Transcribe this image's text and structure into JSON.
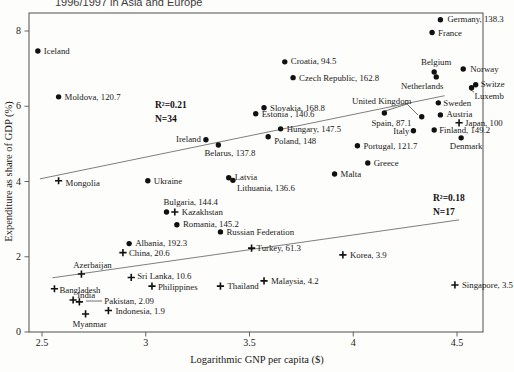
{
  "title": "1996/1997 in Asia and Europe",
  "chart_data": {
    "type": "scatter",
    "title": "1996/1997 in Asia and Europe",
    "xlabel": "Logarithmic GNP per capita ($)",
    "ylabel": "Expenditure as share of GDP (%)",
    "xlim": [
      2.44,
      4.63
    ],
    "ylim": [
      0,
      8.48
    ],
    "x_ticks": [
      "2.5",
      "3",
      "3.5",
      "4",
      "4.5"
    ],
    "x_tick_values": [
      2.5,
      3,
      3.5,
      4,
      4.5
    ],
    "y_ticks": [
      "0",
      "2",
      "4",
      "6",
      "8"
    ],
    "y_tick_values": [
      0,
      2,
      4,
      6,
      8
    ],
    "grid": false,
    "legend_position": "none",
    "marker_color": "#111111",
    "series": [
      {
        "name": "europe",
        "marker": "dot",
        "stat_label": "R²=0.21",
        "n_label": "N=34",
        "points": [
          {
            "name": "iceland",
            "label": "Iceland",
            "x": 2.48,
            "y": 7.47,
            "anchor": "start",
            "dx": 6,
            "dy": 0
          },
          {
            "name": "moldova",
            "label": "Moldova, 120.7",
            "x": 2.58,
            "y": 6.25,
            "anchor": "start",
            "dx": 6,
            "dy": 0
          },
          {
            "name": "germany",
            "label": "Germany, 138.3",
            "x": 4.42,
            "y": 8.3,
            "anchor": "start",
            "dx": 7,
            "dy": -1
          },
          {
            "name": "france",
            "label": "France",
            "x": 4.38,
            "y": 7.96,
            "anchor": "start",
            "dx": 6,
            "dy": 0
          },
          {
            "name": "croatia",
            "label": "Croatia, 94.5",
            "x": 3.67,
            "y": 7.18,
            "anchor": "start",
            "dx": 6,
            "dy": -1
          },
          {
            "name": "czech-republic",
            "label": "Czech Republic, 162.8",
            "x": 3.71,
            "y": 6.76,
            "anchor": "start",
            "dx": 6,
            "dy": 0
          },
          {
            "name": "belgium",
            "label": "Belgium",
            "x": 4.39,
            "y": 6.91,
            "anchor": "middle",
            "dx": 2,
            "dy": -10
          },
          {
            "name": "netherlands",
            "label": "Netherlands",
            "x": 4.4,
            "y": 6.78,
            "anchor": "middle",
            "dx": -14,
            "dy": 9
          },
          {
            "name": "norway",
            "label": "Norway",
            "x": 4.53,
            "y": 6.99,
            "anchor": "start",
            "dx": 7,
            "dy": 0
          },
          {
            "name": "switzerland",
            "label": "Switze",
            "x": 4.59,
            "y": 6.57,
            "anchor": "start",
            "dx": 5,
            "dy": -1
          },
          {
            "name": "luxembourg",
            "label": "Luxemb",
            "x": 4.57,
            "y": 6.49,
            "anchor": "start",
            "dx": 3,
            "dy": 8
          },
          {
            "name": "sweden",
            "label": "Sweden",
            "x": 4.41,
            "y": 6.09,
            "anchor": "start",
            "dx": 5,
            "dy": 0
          },
          {
            "name": "austria",
            "label": "Austria",
            "x": 4.42,
            "y": 5.77,
            "anchor": "start",
            "dx": 6,
            "dy": -1
          },
          {
            "name": "united-kingdom",
            "label": "United Kingdom",
            "x": 4.33,
            "y": 5.72,
            "anchor": "middle",
            "dx": -40,
            "dy": -16
          },
          {
            "name": "spain",
            "label": "Spain, 87.1",
            "x": 4.15,
            "y": 5.82,
            "anchor": "middle",
            "dx": 7,
            "dy": 10
          },
          {
            "name": "italy",
            "label": "Italy",
            "x": 4.29,
            "y": 5.35,
            "anchor": "end",
            "dx": -4,
            "dy": 0
          },
          {
            "name": "finland",
            "label": "Finland, 149.2",
            "x": 4.39,
            "y": 5.37,
            "anchor": "start",
            "dx": 5,
            "dy": 0
          },
          {
            "name": "denmark",
            "label": "Denmark",
            "x": 4.52,
            "y": 5.16,
            "anchor": "middle",
            "dx": 5,
            "dy": 8
          },
          {
            "name": "slovakia",
            "label": "Slovakia, 168.8",
            "x": 3.57,
            "y": 5.96,
            "anchor": "start",
            "dx": 6,
            "dy": 0
          },
          {
            "name": "estonia",
            "label": "Estonia , 140.6",
            "x": 3.53,
            "y": 5.8,
            "anchor": "start",
            "dx": 6,
            "dy": 0
          },
          {
            "name": "hungary",
            "label": "Hungary, 147.5",
            "x": 3.65,
            "y": 5.4,
            "anchor": "start",
            "dx": 6,
            "dy": 0
          },
          {
            "name": "poland",
            "label": "Poland, 148",
            "x": 3.59,
            "y": 5.19,
            "anchor": "start",
            "dx": 6,
            "dy": 4
          },
          {
            "name": "ireland",
            "label": "Ireland",
            "x": 3.29,
            "y": 5.11,
            "anchor": "end",
            "dx": -5,
            "dy": -1
          },
          {
            "name": "belarus",
            "label": "Belarus, 137.8",
            "x": 3.35,
            "y": 4.97,
            "anchor": "start",
            "dx": -14,
            "dy": 8
          },
          {
            "name": "ukraine",
            "label": "Ukraine",
            "x": 3.01,
            "y": 4.02,
            "anchor": "start",
            "dx": 6,
            "dy": 0
          },
          {
            "name": "latvia",
            "label": "Latvia",
            "x": 3.4,
            "y": 4.1,
            "anchor": "start",
            "dx": 6,
            "dy": -1
          },
          {
            "name": "lithuania",
            "label": "Lithuania, 136.6",
            "x": 3.42,
            "y": 4.03,
            "anchor": "start",
            "dx": 4,
            "dy": 8
          },
          {
            "name": "bulgaria",
            "label": "Bulgaria, 144.4",
            "x": 3.1,
            "y": 3.19,
            "anchor": "start",
            "dx": -3,
            "dy": -10
          },
          {
            "name": "romania",
            "label": "Romania, 145.2",
            "x": 3.15,
            "y": 2.85,
            "anchor": "start",
            "dx": 6,
            "dy": -1
          },
          {
            "name": "russian-federation",
            "label": "Russian Federation",
            "x": 3.36,
            "y": 2.66,
            "anchor": "start",
            "dx": 6,
            "dy": 0
          },
          {
            "name": "albania",
            "label": "Albania, 192.3",
            "x": 2.92,
            "y": 2.35,
            "anchor": "start",
            "dx": 6,
            "dy": -1
          },
          {
            "name": "greece",
            "label": "Greece",
            "x": 4.07,
            "y": 4.49,
            "anchor": "start",
            "dx": 6,
            "dy": 0
          },
          {
            "name": "malta",
            "label": "Malta",
            "x": 3.91,
            "y": 4.2,
            "anchor": "start",
            "dx": 6,
            "dy": 0
          },
          {
            "name": "portugal",
            "label": "Portugal, 121.7",
            "x": 4.02,
            "y": 4.95,
            "anchor": "start",
            "dx": 6,
            "dy": 0
          }
        ]
      },
      {
        "name": "asia",
        "marker": "cross",
        "stat_label": "R²=0.18",
        "n_label": "N=17",
        "points": [
          {
            "name": "japan",
            "label": "Japan, 100",
            "x": 4.51,
            "y": 5.56,
            "anchor": "start",
            "dx": 6,
            "dy": 0
          },
          {
            "name": "mongolia",
            "label": "Mongolia",
            "x": 2.58,
            "y": 4.02,
            "anchor": "start",
            "dx": 7,
            "dy": 2
          },
          {
            "name": "kazakhstan",
            "label": "Kazakhstan",
            "x": 3.14,
            "y": 3.19,
            "anchor": "start",
            "dx": 7,
            "dy": 0
          },
          {
            "name": "china",
            "label": "China, 20.6",
            "x": 2.89,
            "y": 2.11,
            "anchor": "start",
            "dx": 6,
            "dy": 0
          },
          {
            "name": "azerbaijan",
            "label": "Azerbaijan",
            "x": 2.69,
            "y": 1.54,
            "anchor": "middle",
            "dx": 11,
            "dy": -9
          },
          {
            "name": "sri-lanka",
            "label": "Sri Lanka, 10.6",
            "x": 2.93,
            "y": 1.45,
            "anchor": "start",
            "dx": 6,
            "dy": -1
          },
          {
            "name": "bangladesh",
            "label": "Bangladesh",
            "x": 2.56,
            "y": 1.15,
            "anchor": "start",
            "dx": 5,
            "dy": 1
          },
          {
            "name": "philippines",
            "label": "Philippines",
            "x": 3.03,
            "y": 1.22,
            "anchor": "start",
            "dx": 6,
            "dy": 1
          },
          {
            "name": "thailand",
            "label": "Thailand",
            "x": 3.36,
            "y": 1.22,
            "anchor": "start",
            "dx": 7,
            "dy": 0
          },
          {
            "name": "india",
            "label": "India",
            "x": 2.65,
            "y": 0.85,
            "anchor": "start",
            "dx": 4,
            "dy": -5
          },
          {
            "name": "pakistan",
            "label": "Pakistan, 2.09",
            "x": 2.68,
            "y": 0.8,
            "anchor": "start",
            "dx": 25,
            "dy": -1
          },
          {
            "name": "indonesia",
            "label": "Indonesia, 1.9",
            "x": 2.82,
            "y": 0.57,
            "anchor": "start",
            "dx": 7,
            "dy": 0
          },
          {
            "name": "myanmar",
            "label": "Myanmar",
            "x": 2.71,
            "y": 0.48,
            "anchor": "middle",
            "dx": 4,
            "dy": 10
          },
          {
            "name": "turkey",
            "label": "Turkey, 61.3",
            "x": 3.51,
            "y": 2.23,
            "anchor": "start",
            "dx": 5,
            "dy": 0
          },
          {
            "name": "korea",
            "label": "Korea, 3.9",
            "x": 3.95,
            "y": 2.05,
            "anchor": "start",
            "dx": 7,
            "dy": 0
          },
          {
            "name": "malaysia",
            "label": "Malaysia, 4.2",
            "x": 3.57,
            "y": 1.36,
            "anchor": "start",
            "dx": 7,
            "dy": 0
          },
          {
            "name": "singapore",
            "label": "Singapore, 3.5",
            "x": 4.49,
            "y": 1.25,
            "anchor": "start",
            "dx": 7,
            "dy": 0
          }
        ]
      }
    ],
    "trend_lines": [
      {
        "name": "europe-trend",
        "x1": 2.49,
        "y1": 4.07,
        "x2": 4.44,
        "y2": 6.28
      },
      {
        "name": "asia-trend",
        "x1": 2.55,
        "y1": 1.44,
        "x2": 4.51,
        "y2": 2.98
      }
    ],
    "annotations": [
      {
        "name": "europe-stats",
        "line1": "R²=0.21",
        "line2": "N=34",
        "px": 155,
        "py": 104
      },
      {
        "name": "asia-stats",
        "line1": "R²=0.18",
        "line2": "N=17",
        "px": 433,
        "py": 197
      }
    ],
    "leader_lines_px": [
      [
        407,
        104,
        385,
        111
      ],
      [
        407,
        104,
        418,
        115
      ],
      [
        86,
        301,
        102,
        301
      ],
      [
        474,
        92,
        470,
        89.5
      ]
    ]
  }
}
